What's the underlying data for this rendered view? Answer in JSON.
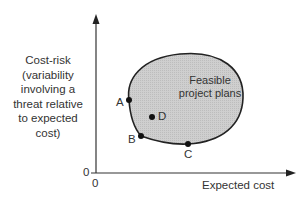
{
  "diagram": {
    "type": "feasible-region-plot",
    "y_axis": {
      "label_lines": [
        "Cost-risk",
        "(variability",
        "involving a",
        "threat relative",
        "to expected",
        "cost)"
      ],
      "origin_label": "0"
    },
    "x_axis": {
      "label": "Expected cost",
      "origin_label": "0"
    },
    "region": {
      "label_lines": [
        "Feasible",
        "project plans"
      ],
      "fill": "#c8c8c8",
      "stroke": "#222222"
    },
    "points": [
      {
        "id": "A",
        "label": "A"
      },
      {
        "id": "B",
        "label": "B"
      },
      {
        "id": "C",
        "label": "C"
      },
      {
        "id": "D",
        "label": "D"
      }
    ]
  }
}
